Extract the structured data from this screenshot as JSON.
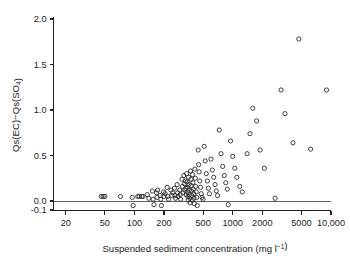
{
  "chart_data": {
    "type": "scatter",
    "title": "",
    "xlabel": "Suspended sediment concentration (mg l⁻¹)",
    "ylabel": "Qs(EC)−Qs(SO₄)",
    "xscale": "log",
    "yscale": "linear",
    "xlim": [
      15,
      10000
    ],
    "ylim": [
      -0.1,
      2.0
    ],
    "grid": false,
    "legend": null,
    "marker": "open-circle",
    "marker_color": "#2b2b2b",
    "reference_lines": [
      {
        "axis": "y",
        "value": 0.0,
        "style": "solid",
        "color": "#4f4f4f"
      }
    ],
    "xticks": [
      20,
      50,
      100,
      200,
      500,
      1000,
      2000,
      5000,
      10000
    ],
    "xtick_labels": [
      "20",
      "50",
      "100",
      "200",
      "500",
      "1000",
      "2000",
      "5000",
      "10,000"
    ],
    "yticks": [
      -0.1,
      0.0,
      0.5,
      1.0,
      1.5,
      2.0
    ],
    "ytick_labels": [
      "-0.1",
      "0.0",
      "0.5",
      "1.0",
      "1.5",
      "2.0"
    ],
    "points": [
      [
        46,
        0.05
      ],
      [
        48,
        0.05
      ],
      [
        50,
        0.05
      ],
      [
        72,
        0.05
      ],
      [
        95,
        0.04
      ],
      [
        97,
        -0.05
      ],
      [
        108,
        0.05
      ],
      [
        112,
        0.05
      ],
      [
        118,
        0.05
      ],
      [
        122,
        0.05
      ],
      [
        135,
        0.07
      ],
      [
        140,
        0.03
      ],
      [
        152,
        0.11
      ],
      [
        155,
        0.02
      ],
      [
        158,
        -0.04
      ],
      [
        168,
        0.09
      ],
      [
        170,
        0.04
      ],
      [
        172,
        0.12
      ],
      [
        182,
        0.06
      ],
      [
        185,
        0.02
      ],
      [
        188,
        -0.05
      ],
      [
        198,
        0.1
      ],
      [
        200,
        0.05
      ],
      [
        205,
        0.08
      ],
      [
        215,
        0.15
      ],
      [
        218,
        0.05
      ],
      [
        222,
        0.02
      ],
      [
        235,
        0.12
      ],
      [
        240,
        0.06
      ],
      [
        245,
        0.09
      ],
      [
        255,
        0.14
      ],
      [
        258,
        0.06
      ],
      [
        262,
        0.03
      ],
      [
        272,
        0.18
      ],
      [
        275,
        0.09
      ],
      [
        278,
        0.05
      ],
      [
        288,
        0.12
      ],
      [
        292,
        0.07
      ],
      [
        295,
        0.02
      ],
      [
        305,
        0.24
      ],
      [
        308,
        0.16
      ],
      [
        312,
        0.09
      ],
      [
        318,
        0.28
      ],
      [
        322,
        0.19
      ],
      [
        325,
        0.12
      ],
      [
        330,
        0.22
      ],
      [
        333,
        0.14
      ],
      [
        336,
        0.07
      ],
      [
        340,
        0.3
      ],
      [
        343,
        0.21
      ],
      [
        345,
        0.15
      ],
      [
        348,
        0.1
      ],
      [
        350,
        0.05
      ],
      [
        352,
        0.01
      ],
      [
        355,
        0.26
      ],
      [
        358,
        0.18
      ],
      [
        360,
        0.12
      ],
      [
        362,
        0.07
      ],
      [
        365,
        0.03
      ],
      [
        368,
        -0.02
      ],
      [
        372,
        0.33
      ],
      [
        375,
        0.24
      ],
      [
        378,
        0.17
      ],
      [
        380,
        0.11
      ],
      [
        383,
        0.06
      ],
      [
        386,
        0.01
      ],
      [
        390,
        0.29
      ],
      [
        393,
        0.2
      ],
      [
        396,
        0.13
      ],
      [
        400,
        0.08
      ],
      [
        403,
        0.03
      ],
      [
        406,
        -0.03
      ],
      [
        412,
        0.35
      ],
      [
        416,
        0.25
      ],
      [
        420,
        0.16
      ],
      [
        425,
        0.1
      ],
      [
        430,
        0.04
      ],
      [
        436,
        -0.05
      ],
      [
        445,
        0.56
      ],
      [
        450,
        0.4
      ],
      [
        455,
        0.32
      ],
      [
        462,
        0.22
      ],
      [
        470,
        0.15
      ],
      [
        478,
        0.08
      ],
      [
        488,
        0.04
      ],
      [
        498,
        0.02
      ],
      [
        512,
        0.6
      ],
      [
        525,
        0.44
      ],
      [
        538,
        0.3
      ],
      [
        552,
        0.22
      ],
      [
        565,
        0.14
      ],
      [
        580,
        0.08
      ],
      [
        600,
        0.46
      ],
      [
        620,
        0.34
      ],
      [
        640,
        0.26
      ],
      [
        660,
        0.18
      ],
      [
        680,
        0.11
      ],
      [
        700,
        0.06
      ],
      [
        730,
        0.78
      ],
      [
        760,
        0.52
      ],
      [
        790,
        0.38
      ],
      [
        820,
        0.28
      ],
      [
        850,
        0.2
      ],
      [
        880,
        0.13
      ],
      [
        900,
        -0.04
      ],
      [
        950,
        0.66
      ],
      [
        1000,
        0.49
      ],
      [
        1050,
        0.36
      ],
      [
        1100,
        0.26
      ],
      [
        1180,
        0.16
      ],
      [
        1250,
        0.1
      ],
      [
        1400,
        0.52
      ],
      [
        1500,
        0.74
      ],
      [
        1600,
        1.02
      ],
      [
        1750,
        0.88
      ],
      [
        1900,
        0.56
      ],
      [
        2100,
        0.36
      ],
      [
        2700,
        0.03
      ],
      [
        3100,
        1.22
      ],
      [
        3400,
        0.96
      ],
      [
        4100,
        0.64
      ],
      [
        4700,
        1.78
      ],
      [
        6200,
        0.57
      ],
      [
        9000,
        1.22
      ]
    ]
  }
}
